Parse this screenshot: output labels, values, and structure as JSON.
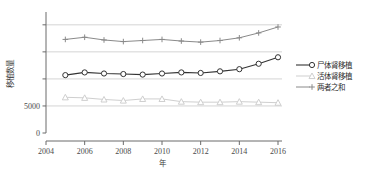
{
  "chart_data": {
    "type": "line",
    "title": "",
    "xlabel": "年",
    "ylabel": "移植数量",
    "x": [
      2005,
      2006,
      2007,
      2008,
      2009,
      2010,
      2011,
      2012,
      2013,
      2014,
      2015,
      2016
    ],
    "xlim": [
      2004,
      2016
    ],
    "ylim": [
      0,
      22000
    ],
    "xticks": [
      2004,
      2006,
      2008,
      2010,
      2012,
      2014,
      2016
    ],
    "xticklabels": [
      "2004",
      "2006",
      "2008",
      "2010",
      "2012",
      "2014",
      "2016"
    ],
    "yticks": [
      0,
      5000,
      10000,
      15000,
      20000
    ],
    "yticklabels": [
      "0",
      "5000",
      "",
      "",
      ""
    ],
    "grid": true,
    "legend_position": "right",
    "series": [
      {
        "name": "尸体肾移植",
        "marker": "circle",
        "color": "#333333",
        "values": [
          10700,
          11200,
          11000,
          10900,
          10800,
          11000,
          11200,
          11100,
          11400,
          11800,
          12800,
          14000
        ]
      },
      {
        "name": "活体肾移植",
        "marker": "triangle",
        "color": "#cfcfcf",
        "values": [
          6600,
          6500,
          6200,
          6000,
          6300,
          6300,
          5800,
          5700,
          5700,
          5800,
          5700,
          5600
        ]
      },
      {
        "name": "两者之和",
        "marker": "plus",
        "color": "#8a8a8a",
        "values": [
          17300,
          17700,
          17200,
          16900,
          17100,
          17300,
          17000,
          16800,
          17100,
          17600,
          18500,
          19600
        ]
      }
    ]
  }
}
